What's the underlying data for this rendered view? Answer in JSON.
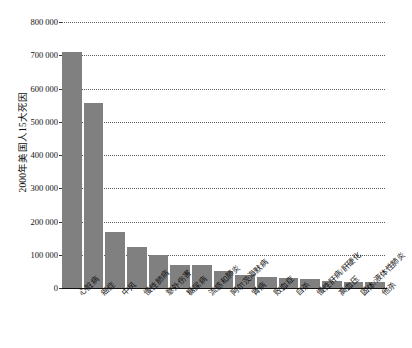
{
  "chart_data": {
    "type": "bar",
    "title": "",
    "xlabel": "",
    "ylabel": "2000年美国人15大死因",
    "ylim": [
      0,
      800000
    ],
    "ytick_labels": [
      "800 000",
      "700 000",
      "600 000",
      "500 000",
      "400 000",
      "300 000",
      "200 000",
      "100 000",
      "0"
    ],
    "ytick_values": [
      800000,
      700000,
      600000,
      500000,
      400000,
      300000,
      200000,
      100000,
      0
    ],
    "grid": true,
    "grid_style": "dotted",
    "legend": false,
    "bar_color": "#808080",
    "categories": [
      "心脏病",
      "癌症",
      "中风",
      "慢性肺病",
      "意外伤害",
      "糖尿病",
      "流感和肺炎",
      "阿尔茨海默病",
      "肾病",
      "败血症",
      "自杀",
      "慢性肝病/肝硬化",
      "高血压",
      "固体/液体性肺炎",
      "他杀"
    ],
    "values": [
      710000,
      555000,
      168000,
      123000,
      98000,
      70000,
      68000,
      50000,
      38000,
      32000,
      30000,
      27000,
      20000,
      18000,
      17000
    ]
  }
}
